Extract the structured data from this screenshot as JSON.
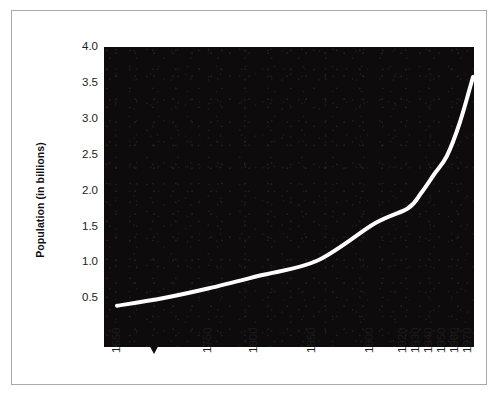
{
  "figure": {
    "background_color": "#ffffff",
    "border_color": "#a9a9a9",
    "plot_background_color": "#0d0b0b",
    "line_color": "#ffffff"
  },
  "axes": {
    "y_title": "Population (in billions)",
    "y_ticks": [
      "4.0",
      "3.5",
      "3.0",
      "2.5",
      "2.0",
      "1.5",
      "1.0",
      "0.5"
    ],
    "x_ticks": [
      "1650",
      "1750",
      "1800",
      "1850",
      "1900",
      "1920",
      "1930",
      "1940",
      "1950",
      "1960",
      "1970"
    ]
  },
  "marker": {
    "name": "period-marker-1700",
    "label": ""
  },
  "chart_data": {
    "type": "line",
    "title": "",
    "xlabel": "",
    "ylabel": "Population (in billions)",
    "xlim": [
      1650,
      1970
    ],
    "ylim": [
      0.0,
      4.0
    ],
    "grid": false,
    "legend": "none",
    "x_tick_labels": [
      "1650",
      "1750",
      "1800",
      "1850",
      "1900",
      "1920",
      "1930",
      "1940",
      "1950",
      "1960",
      "1970"
    ],
    "y_tick_labels": [
      "0.5",
      "1.0",
      "1.5",
      "2.0",
      "2.5",
      "3.0",
      "3.5",
      "4.0"
    ],
    "series": [
      {
        "name": "World population",
        "x": [
          1650,
          1700,
          1750,
          1800,
          1850,
          1900,
          1920,
          1930,
          1940,
          1950,
          1960,
          1970
        ],
        "values": [
          0.55,
          0.65,
          0.78,
          0.95,
          1.15,
          1.65,
          1.85,
          2.05,
          2.3,
          2.55,
          3.0,
          3.6
        ]
      }
    ],
    "annotations": [
      {
        "type": "triangle-marker",
        "x": 1700,
        "position": "below-axis"
      }
    ]
  }
}
